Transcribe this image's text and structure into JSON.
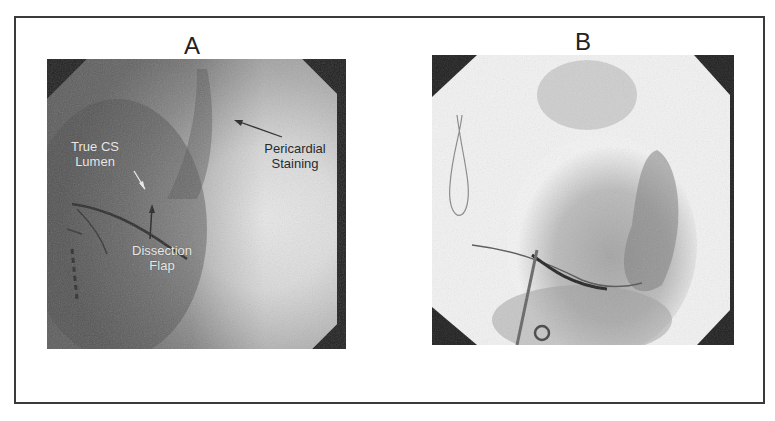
{
  "figure": {
    "panels": [
      {
        "letter": "A",
        "annotations": {
          "true_cs_lumen": [
            "True CS",
            "Lumen"
          ],
          "pericardial_staining": [
            "Pericardial",
            "Staining"
          ],
          "dissection_flap": [
            "Dissection",
            "Flap"
          ]
        }
      },
      {
        "letter": "B"
      }
    ]
  }
}
